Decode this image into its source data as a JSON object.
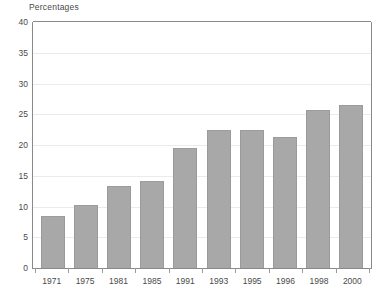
{
  "chart_data": {
    "type": "bar",
    "title": "Percentages",
    "xlabel": "",
    "ylabel": "Percentages",
    "categories": [
      "1971",
      "1975",
      "1981",
      "1985",
      "1991",
      "1993",
      "1995",
      "1996",
      "1998",
      "2000"
    ],
    "values": [
      8.5,
      10.3,
      13.3,
      14.2,
      19.5,
      22.4,
      22.4,
      21.3,
      25.7,
      26.5
    ],
    "ylim": [
      0,
      40
    ],
    "ytick_labels": [
      "0",
      "5",
      "10",
      "15",
      "20",
      "25",
      "30",
      "35",
      "40"
    ],
    "ytick_values": [
      0,
      5,
      10,
      15,
      20,
      25,
      30,
      35,
      40
    ],
    "grid": true,
    "legend": "none",
    "bar_color": "#a8a8a8",
    "grid_color": "#ebebeb",
    "axis_color": "#8a8a8a",
    "text_color": "#4a4a4a"
  }
}
